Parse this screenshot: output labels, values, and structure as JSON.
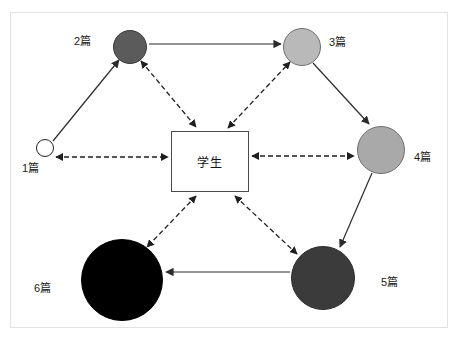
{
  "diagram": {
    "center": {
      "label": "学生",
      "shape": "rectangle",
      "x": 210,
      "y": 161,
      "width": 78,
      "height": 61,
      "fill": "#ffffff",
      "stroke": "#4a4a4a"
    },
    "nodes": [
      {
        "id": "n1",
        "label": "1篇",
        "count": 1,
        "cx": 45,
        "cy": 148,
        "r": 9,
        "fill": "#ffffff",
        "stroke": "#222222",
        "label_x": 22,
        "label_y": 163
      },
      {
        "id": "n2",
        "label": "2篇",
        "count": 2,
        "cx": 130,
        "cy": 47,
        "r": 17,
        "fill": "#5b5b5b",
        "stroke": "#3a3a3a",
        "label_x": 74,
        "label_y": 36
      },
      {
        "id": "n3",
        "label": "3篇",
        "count": 3,
        "cx": 302,
        "cy": 47,
        "r": 19,
        "fill": "#b9b9b9",
        "stroke": "#6f6f6f",
        "label_x": 329,
        "label_y": 37
      },
      {
        "id": "n4",
        "label": "4篇",
        "count": 4,
        "cx": 381,
        "cy": 150,
        "r": 24,
        "fill": "#a9a9a9",
        "stroke": "#6f6f6f",
        "label_x": 414,
        "label_y": 152
      },
      {
        "id": "n5",
        "label": "5篇",
        "count": 5,
        "cx": 323,
        "cy": 278,
        "r": 32,
        "fill": "#3b3b3b",
        "stroke": "#2b2b2b",
        "label_x": 381,
        "label_y": 277
      },
      {
        "id": "n6",
        "label": "6篇",
        "count": 6,
        "cx": 122,
        "cy": 280,
        "r": 41,
        "fill": "#000000",
        "stroke": "#000000",
        "label_x": 34,
        "label_y": 283
      }
    ],
    "solid_edges": [
      {
        "name": "edge-1-to-2",
        "from": "n1",
        "to": "n2",
        "x1": 53,
        "y1": 141,
        "x2": 119,
        "y2": 60
      },
      {
        "name": "edge-2-to-3",
        "from": "n2",
        "to": "n3",
        "x1": 149,
        "y1": 44,
        "x2": 281,
        "y2": 44
      },
      {
        "name": "edge-3-to-4",
        "from": "n3",
        "to": "n4",
        "x1": 313,
        "y1": 63,
        "x2": 369,
        "y2": 124
      },
      {
        "name": "edge-4-to-5",
        "from": "n4",
        "to": "n5",
        "x1": 372,
        "y1": 173,
        "x2": 340,
        "y2": 247
      },
      {
        "name": "edge-5-to-6",
        "from": "n5",
        "to": "n6",
        "x1": 290,
        "y1": 272,
        "x2": 166,
        "y2": 272
      }
    ],
    "dashed_edges": [
      {
        "name": "edge-1-center",
        "from": "n1",
        "to": "center",
        "x1": 56,
        "y1": 157,
        "x2": 168,
        "y2": 157,
        "arrow_start": true,
        "arrow_end": true
      },
      {
        "name": "edge-2-center",
        "from": "n2",
        "to": "center",
        "x1": 141,
        "y1": 61,
        "x2": 196,
        "y2": 127,
        "arrow_start": true,
        "arrow_end": true
      },
      {
        "name": "edge-3-center",
        "from": "center",
        "to": "n3",
        "x1": 228,
        "y1": 128,
        "x2": 290,
        "y2": 62,
        "arrow_start": true,
        "arrow_end": true
      },
      {
        "name": "edge-4-center",
        "from": "center",
        "to": "n4",
        "x1": 252,
        "y1": 156,
        "x2": 354,
        "y2": 156,
        "arrow_start": true,
        "arrow_end": true
      },
      {
        "name": "edge-5-center",
        "from": "center",
        "to": "n5",
        "x1": 235,
        "y1": 196,
        "x2": 297,
        "y2": 254,
        "arrow_start": true,
        "arrow_end": true
      },
      {
        "name": "edge-6-center",
        "from": "center",
        "to": "n6",
        "x1": 196,
        "y1": 196,
        "x2": 147,
        "y2": 247,
        "arrow_start": true,
        "arrow_end": true
      }
    ],
    "style": {
      "background": "#ffffff",
      "frame_stroke": "#e2e2e2",
      "solid_stroke": "#2b2b2b",
      "dashed_stroke": "#1f1f1f",
      "label_color": "#1a1a1a"
    }
  }
}
